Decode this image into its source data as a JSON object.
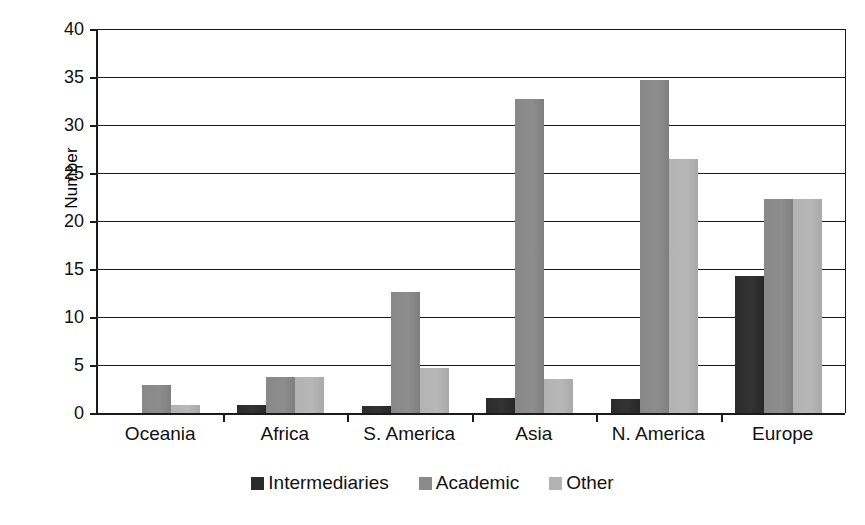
{
  "chart_data": {
    "type": "bar",
    "title": "",
    "xlabel": "",
    "ylabel": "Number",
    "ylim": [
      0,
      40
    ],
    "ytick_step": 5,
    "yticks": [
      0,
      5,
      10,
      15,
      20,
      25,
      30,
      35,
      40
    ],
    "grid": true,
    "legend_position": "bottom-center",
    "categories": [
      "Oceania",
      "Africa",
      "S. America",
      "Asia",
      "N. America",
      "Europe"
    ],
    "series": [
      {
        "name": "Intermediaries",
        "color": "#2b2b2b",
        "values": [
          0,
          0.8,
          0.7,
          1.6,
          1.5,
          14.3
        ]
      },
      {
        "name": "Academic",
        "color": "#8a8a8a",
        "values": [
          2.9,
          3.8,
          12.6,
          32.7,
          34.7,
          22.3
        ]
      },
      {
        "name": "Other",
        "color": "#b3b3b3",
        "values": [
          0.8,
          3.8,
          4.7,
          3.5,
          26.5,
          22.3
        ]
      }
    ]
  },
  "axis": {
    "y_title": "Number",
    "tick_labels": [
      "40",
      "35",
      "30",
      "25",
      "20",
      "15",
      "10",
      "5",
      "0"
    ]
  },
  "legend": {
    "items": [
      {
        "label": "Intermediaries",
        "swatch": "dark-gray-swatch"
      },
      {
        "label": "Academic",
        "swatch": "medium-gray-swatch"
      },
      {
        "label": "Other",
        "swatch": "light-gray-swatch"
      }
    ]
  }
}
